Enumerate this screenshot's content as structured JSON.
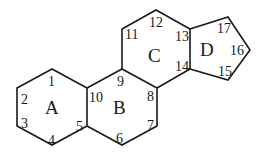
{
  "diagram": {
    "rings": [
      {
        "label": "A",
        "x": 45,
        "y": 114
      },
      {
        "label": "B",
        "x": 113,
        "y": 114
      },
      {
        "label": "C",
        "x": 148,
        "y": 55
      },
      {
        "label": "D",
        "x": 204,
        "y": 56
      }
    ],
    "atoms": [
      {
        "label": "1",
        "x": 48,
        "y": 84
      },
      {
        "label": "2",
        "x": 18,
        "y": 103
      },
      {
        "label": "3",
        "x": 18,
        "y": 128
      },
      {
        "label": "4",
        "x": 48,
        "y": 146
      },
      {
        "label": "5",
        "x": 75,
        "y": 131
      },
      {
        "label": "6",
        "x": 116,
        "y": 144
      },
      {
        "label": "7",
        "x": 147,
        "y": 129
      },
      {
        "label": "8",
        "x": 147,
        "y": 102
      },
      {
        "label": "9",
        "x": 118,
        "y": 85
      },
      {
        "label": "10",
        "x": 88,
        "y": 102
      },
      {
        "label": "11",
        "x": 126,
        "y": 38
      },
      {
        "label": "12",
        "x": 149,
        "y": 27
      },
      {
        "label": "13",
        "x": 175,
        "y": 44
      },
      {
        "label": "14",
        "x": 175,
        "y": 71
      },
      {
        "label": "15",
        "x": 215,
        "y": 76
      },
      {
        "label": "16",
        "x": 222,
        "y": 56
      },
      {
        "label": "17",
        "x": 214,
        "y": 35
      }
    ],
    "bond_color": "#1a1a1a"
  }
}
